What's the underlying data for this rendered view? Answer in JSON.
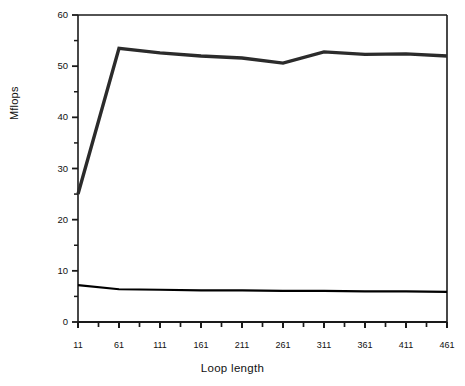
{
  "chart_data": {
    "type": "line",
    "title": "",
    "xlabel": "Loop length",
    "ylabel": "Mflops",
    "xlim": [
      11,
      461
    ],
    "ylim": [
      0,
      60
    ],
    "xticks": [
      11,
      61,
      111,
      161,
      211,
      261,
      311,
      361,
      411,
      461
    ],
    "xtick_labels": [
      "11",
      "61",
      "111",
      "161",
      "211",
      "261",
      "311",
      "361",
      "411",
      "461"
    ],
    "x_minor_step": 25,
    "yticks": [
      0,
      10,
      20,
      30,
      40,
      50,
      60
    ],
    "ytick_labels": [
      "0",
      "10",
      "20",
      "30",
      "40",
      "50",
      "60"
    ],
    "y_minor_step": 5,
    "grid": false,
    "legend": null,
    "x": [
      11,
      61,
      111,
      161,
      211,
      261,
      311,
      361,
      411,
      461
    ],
    "series": [
      {
        "name": "upper-line",
        "color": "#2b2b2b",
        "linewidth": 3.4,
        "values": [
          25.0,
          53.5,
          52.6,
          52.0,
          51.6,
          50.6,
          52.8,
          52.3,
          52.4,
          52.0
        ]
      },
      {
        "name": "lower-line",
        "color": "#000000",
        "linewidth": 2.2,
        "values": [
          7.2,
          6.4,
          6.3,
          6.2,
          6.2,
          6.1,
          6.1,
          6.0,
          6.0,
          5.9
        ]
      }
    ]
  },
  "axes": {
    "ylabel_text": "Mflops",
    "xlabel_text": "Loop length"
  },
  "colors": {
    "axis": "#1a1a1a",
    "frame": "#1a1a1a",
    "background": "#ffffff",
    "upper_series": "#2b2b2b",
    "lower_series": "#000000"
  }
}
